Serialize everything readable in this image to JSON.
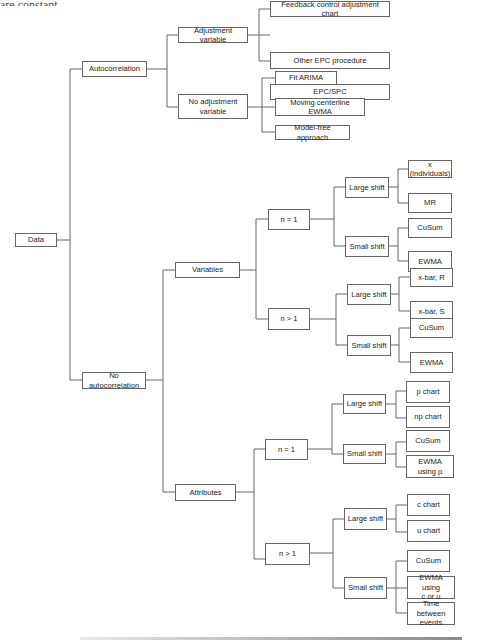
{
  "header_fragment": "are constant.",
  "diagram": {
    "root": "Data",
    "autocorrelation": {
      "label": "Autocorrelation",
      "adjustment_variable": {
        "label": "Adjustment variable",
        "leaves": [
          "Feedback control adjustment chart",
          "Other EPC procedure",
          "EPC/SPC"
        ]
      },
      "no_adjustment_variable": {
        "label": "No adjustment\nvariable",
        "leaves": [
          "Fit ARIMA",
          "Moving centerline EWMA",
          "Model-free approach"
        ]
      }
    },
    "no_autocorrelation": {
      "label": "No autocorrelation",
      "variables": {
        "label": "Variables",
        "n1": {
          "label": "n = 1",
          "large_shift": {
            "label": "Large shift",
            "leaves": [
              "x (individuals)",
              "MR"
            ]
          },
          "small_shift": {
            "label": "Small shift",
            "leaves": [
              "CuSum",
              "EWMA"
            ]
          }
        },
        "ngt1": {
          "label": "n > 1",
          "large_shift": {
            "label": "Large shift",
            "leaves": [
              "x-bar, R",
              "x-bar, S"
            ]
          },
          "small_shift": {
            "label": "Small shift",
            "leaves": [
              "CuSum",
              "EWMA"
            ]
          }
        }
      },
      "attributes": {
        "label": "Attributes",
        "n1": {
          "label": "n = 1",
          "large_shift": {
            "label": "Large shift",
            "leaves": [
              "p chart",
              "np chart"
            ]
          },
          "small_shift": {
            "label": "Small shift",
            "leaves": [
              "CuSum",
              "EWMA using p"
            ]
          }
        },
        "ngt1": {
          "label": "n > 1",
          "large_shift": {
            "label": "Large shift",
            "leaves": [
              "c chart",
              "u chart"
            ]
          },
          "small_shift": {
            "label": "Small shift",
            "leaves": [
              "CuSum",
              "EWMA using\nc or u",
              "Time between\nevents"
            ]
          }
        }
      }
    }
  }
}
